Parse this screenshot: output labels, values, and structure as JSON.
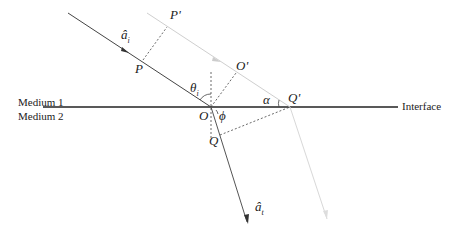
{
  "diagram": {
    "labels": {
      "medium1": "Medium 1",
      "medium2": "Medium 2",
      "interface": "Interface",
      "P": "P",
      "P_prime": "P'",
      "O": "O",
      "O_prime": "O'",
      "Q": "Q",
      "Q_prime": "Q'",
      "theta_i": "θ",
      "theta_i_sub": "i",
      "alpha": "α",
      "phi": "ϕ",
      "a_i": "â",
      "a_i_sub": "i",
      "a_t": "â",
      "a_t_sub": "t"
    },
    "colors": {
      "main_line": "#333333",
      "faint_ray": "#c8c8c8",
      "dashed": "#444444"
    }
  }
}
